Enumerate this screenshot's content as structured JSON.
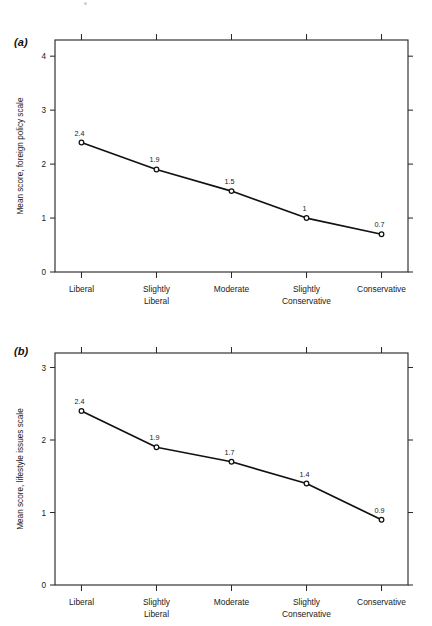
{
  "figure": {
    "width": 432,
    "height": 626,
    "background": "#ffffff",
    "ink_color": "#111111"
  },
  "panels": [
    {
      "tag": "(a)",
      "tag_x": 14,
      "tag_y": 36,
      "chart_index": 0
    },
    {
      "tag": "(b)",
      "tag_x": 14,
      "tag_y": 345,
      "chart_index": 1
    }
  ],
  "chart_data": [
    {
      "type": "line",
      "panel": "(a)",
      "title": "",
      "xlabel": "",
      "ylabel": "Mean score, foreign policy scale",
      "categories": [
        "Liberal",
        "Slightly Liberal",
        "Moderate",
        "Slightly Conservative",
        "Conservative"
      ],
      "category_lines": [
        [
          "Liberal"
        ],
        [
          "Slightly",
          "Liberal"
        ],
        [
          "Moderate"
        ],
        [
          "Slightly",
          "Conservative"
        ],
        [
          "Conservative"
        ]
      ],
      "values": [
        2.4,
        1.9,
        1.5,
        1.0,
        0.7
      ],
      "point_labels": [
        "2.4",
        "1.9",
        "1.5",
        "1",
        "0.7"
      ],
      "ylim": [
        0,
        4.3
      ],
      "yticks": [
        0,
        1,
        2,
        3,
        4
      ],
      "ytick_labels": [
        "0",
        "1",
        "2",
        "3",
        "4"
      ],
      "grid": false,
      "legend": "none",
      "marker": "circle-open",
      "ticks_all_sides": true,
      "tick_direction": "outward"
    },
    {
      "type": "line",
      "panel": "(b)",
      "title": "",
      "xlabel": "",
      "ylabel": "Mean score, lifestyle issues scale",
      "categories": [
        "Liberal",
        "Slightly Liberal",
        "Moderate",
        "Slightly Conservative",
        "Conservative"
      ],
      "category_lines": [
        [
          "Liberal"
        ],
        [
          "Slightly",
          "Liberal"
        ],
        [
          "Moderate"
        ],
        [
          "Slightly",
          "Conservative"
        ],
        [
          "Conservative"
        ]
      ],
      "values": [
        2.4,
        1.9,
        1.7,
        1.4,
        0.9
      ],
      "point_labels": [
        "2.4",
        "1.9",
        "1.7",
        "1.4",
        "0.9"
      ],
      "ylim": [
        0,
        3.2
      ],
      "yticks": [
        0,
        1,
        2,
        3
      ],
      "ytick_labels": [
        "0",
        "1",
        "2",
        "3"
      ],
      "grid": false,
      "legend": "none",
      "marker": "circle-open",
      "ticks_all_sides": true,
      "tick_direction": "outward"
    }
  ]
}
